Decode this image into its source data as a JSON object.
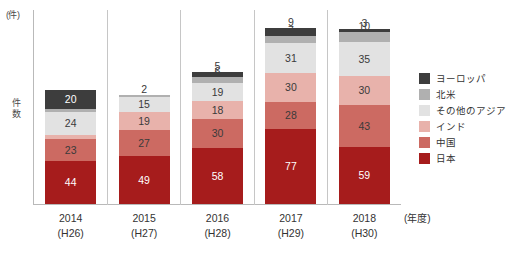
{
  "chart_data": {
    "type": "bar",
    "subtype": "stacked-vertical",
    "title": "",
    "xlabel": "(年度)",
    "ylabel": "件数",
    "yunit": "(件)",
    "ylim": [
      0,
      200
    ],
    "grid": false,
    "legend_position": "right",
    "categories": [
      "2014",
      "2015",
      "2016",
      "2017",
      "2018"
    ],
    "category_sublabels": [
      "(H26)",
      "(H27)",
      "(H28)",
      "(H29)",
      "(H30)"
    ],
    "series": [
      {
        "name": "日本",
        "color": "#a61c1c",
        "values": [
          44,
          49,
          58,
          77,
          59
        ]
      },
      {
        "name": "中国",
        "color": "#cc6a62",
        "values": [
          23,
          27,
          30,
          28,
          43
        ]
      },
      {
        "name": "インド",
        "color": "#e8b2ab",
        "values": [
          4,
          19,
          18,
          30,
          30
        ]
      },
      {
        "name": "その他のアジア",
        "color": "#e2e2e2",
        "values": [
          24,
          15,
          19,
          31,
          35
        ]
      },
      {
        "name": "北米",
        "color": "#b0b0b0",
        "values": [
          3,
          2,
          6,
          7,
          10
        ]
      },
      {
        "name": "ヨーロッパ",
        "color": "#3d3d3d",
        "values": [
          20,
          0,
          5,
          9,
          3
        ]
      }
    ],
    "legend_order": [
      "ヨーロッパ",
      "北米",
      "その他のアジア",
      "インド",
      "中国",
      "日本"
    ],
    "totals": [
      118,
      112,
      136,
      182,
      180
    ]
  },
  "axis": {
    "y_unit_label": "(件)",
    "y_title": "件数",
    "x_unit_label": "(年度)"
  },
  "legend": {
    "items": [
      {
        "label": "ヨーロッパ",
        "color": "#3d3d3d"
      },
      {
        "label": "北米",
        "color": "#b0b0b0"
      },
      {
        "label": "その他のアジア",
        "color": "#e2e2e2"
      },
      {
        "label": "インド",
        "color": "#e8b2ab"
      },
      {
        "label": "中国",
        "color": "#cc6a62"
      },
      {
        "label": "日本",
        "color": "#a61c1c"
      }
    ]
  }
}
